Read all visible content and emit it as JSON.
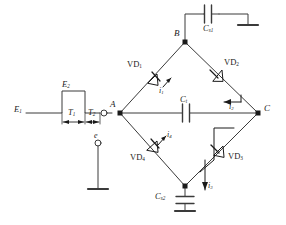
{
  "diagram": {
    "type": "schematic",
    "colors": {
      "wire": "#3a3a3a",
      "text": "#1a1a1a",
      "background": "#ffffff"
    },
    "nodes": [
      {
        "id": "A",
        "label": "A",
        "x": 120,
        "y": 113
      },
      {
        "id": "B",
        "label": "B",
        "x": 185,
        "y": 42
      },
      {
        "id": "C",
        "label": "C",
        "x": 258,
        "y": 113
      },
      {
        "id": "D",
        "label": "",
        "x": 185,
        "y": 186
      }
    ],
    "components": [
      {
        "id": "VD1",
        "label": "VD",
        "sub": "1",
        "kind": "diode",
        "branch": "A-B"
      },
      {
        "id": "VD2",
        "label": "VD",
        "sub": "2",
        "kind": "diode",
        "branch": "B-C"
      },
      {
        "id": "VD3",
        "label": "VD",
        "sub": "3",
        "kind": "diode",
        "branch": "C-D"
      },
      {
        "id": "VD4",
        "label": "VD",
        "sub": "4",
        "kind": "diode",
        "branch": "D-A"
      },
      {
        "id": "Ct",
        "label": "C",
        "sub": "t",
        "kind": "capacitor",
        "branch": "A-C"
      },
      {
        "id": "Cs1",
        "label": "C",
        "sub": "s1",
        "kind": "capacitor",
        "branch": "B-ground"
      },
      {
        "id": "Cs2",
        "label": "C",
        "sub": "s2",
        "kind": "capacitor",
        "branch": "D-ground"
      }
    ],
    "currents": [
      {
        "id": "i1",
        "label": "i",
        "sub": "1",
        "direction": "up-right"
      },
      {
        "id": "i2",
        "label": "i",
        "sub": "2",
        "direction": "left"
      },
      {
        "id": "i3",
        "label": "i",
        "sub": "3",
        "direction": "down"
      },
      {
        "id": "i4",
        "label": "i",
        "sub": "4",
        "direction": "up-right"
      }
    ],
    "source": {
      "waveform": "rectangular-pulse",
      "e1_label": "E",
      "e1_sub": "1",
      "e2_label": "E",
      "e2_sub": "2",
      "t1_label": "T",
      "t1_sub": "1",
      "t2_label": "T",
      "t2_sub": "2",
      "ground_label": "e"
    }
  }
}
